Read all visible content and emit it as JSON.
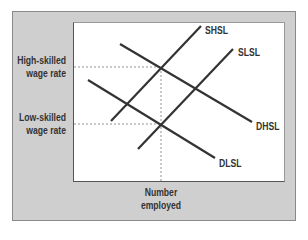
{
  "diagram": {
    "y_labels": {
      "high": {
        "line1": "High-skilled",
        "line2": "wage rate"
      },
      "low": {
        "line1": "Low-skilled",
        "line2": "wage rate"
      }
    },
    "x_label": {
      "line1": "Number",
      "line2": "employed"
    },
    "curves": [
      {
        "id": "SHSL",
        "label": "SHSL",
        "type": "supply"
      },
      {
        "id": "SLSL",
        "label": "SLSL",
        "type": "supply"
      },
      {
        "id": "DHSL",
        "label": "DHSL",
        "type": "demand"
      },
      {
        "id": "DLSL",
        "label": "DLSL",
        "type": "demand"
      }
    ],
    "colors": {
      "frame_bg": "#cfcfcf",
      "plot_bg": "#ffffff",
      "line": "#333333",
      "guide": "#777777"
    }
  }
}
